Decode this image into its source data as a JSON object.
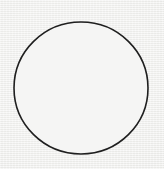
{
  "figure": {
    "canvas": {
      "width": 164,
      "height": 169,
      "background_color": "#ebebe9",
      "texture": "paper-grain"
    },
    "shapes": [
      {
        "name": "circle-outline",
        "type": "circle",
        "center_x": 81,
        "center_y": 88,
        "radius_x": 67,
        "radius_y": 66,
        "stroke_color": "#1f1f1f",
        "stroke_width": 1.6,
        "fill_color": "#f5f5f4"
      }
    ],
    "labels": [],
    "annotations": []
  }
}
